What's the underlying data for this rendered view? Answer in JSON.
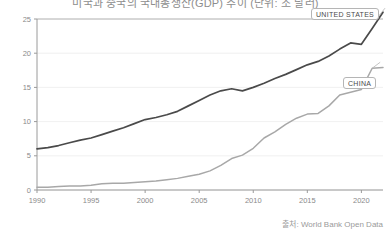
{
  "chart_data": {
    "type": "line",
    "title": "미국과 중국의 국내총생산(GDP) 추이 (단위: 조 달러)",
    "subtitle": "",
    "xlabel": "",
    "ylabel": "",
    "source": "출처: World Bank Open Data",
    "grid": true,
    "legend_position": "inline-callout",
    "xlim": [
      1990,
      2022
    ],
    "ylim": [
      0,
      25
    ],
    "yticks": [
      0,
      5,
      10,
      15,
      20,
      25
    ],
    "ytick_labels": [
      "0",
      "5",
      "10",
      "15",
      "20",
      "25"
    ],
    "xticks": [
      1990,
      1995,
      2000,
      2005,
      2010,
      2015,
      2020
    ],
    "xtick_labels": [
      "1990",
      "1995",
      "2000",
      "2005",
      "2010",
      "2015",
      "2020"
    ],
    "x": [
      1990,
      1991,
      1992,
      1993,
      1994,
      1995,
      1996,
      1997,
      1998,
      1999,
      2000,
      2001,
      2002,
      2003,
      2004,
      2005,
      2006,
      2007,
      2008,
      2009,
      2010,
      2011,
      2012,
      2013,
      2014,
      2015,
      2016,
      2017,
      2018,
      2019,
      2020,
      2021,
      2022
    ],
    "series": [
      {
        "name": "UNITED STATES",
        "color": "#4a4a4a",
        "label_text": "UNITED STATES",
        "values": [
          6.0,
          6.2,
          6.5,
          6.9,
          7.3,
          7.6,
          8.1,
          8.6,
          9.1,
          9.7,
          10.3,
          10.6,
          11.0,
          11.5,
          12.3,
          13.1,
          13.9,
          14.5,
          14.8,
          14.5,
          15.0,
          15.6,
          16.3,
          16.9,
          17.6,
          18.3,
          18.8,
          19.6,
          20.6,
          21.5,
          21.3,
          23.6,
          26.0
        ]
      },
      {
        "name": "CHINA",
        "color": "#a8a8a8",
        "label_text": "CHINA",
        "values": [
          0.4,
          0.4,
          0.5,
          0.6,
          0.6,
          0.7,
          0.9,
          1.0,
          1.0,
          1.1,
          1.2,
          1.3,
          1.5,
          1.7,
          2.0,
          2.3,
          2.8,
          3.6,
          4.6,
          5.1,
          6.1,
          7.6,
          8.5,
          9.6,
          10.5,
          11.1,
          11.2,
          12.3,
          13.9,
          14.3,
          14.7,
          17.8,
          17.9
        ]
      }
    ]
  },
  "colors": {
    "axis": "#9a9a9a",
    "grid": "#ececec",
    "tick_text": "#8a8a8a",
    "title_text": "#8d8d8d",
    "source_text": "#9a9a9a",
    "label_border": "#b5b5b5",
    "label_bg": "#ffffff"
  }
}
